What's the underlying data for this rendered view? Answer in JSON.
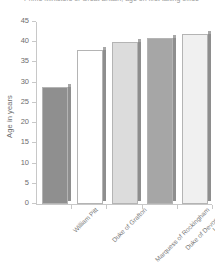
{
  "chart_data": {
    "type": "bar",
    "title": "Prime Ministers of Great Britain, age on first taking office",
    "xlabel": "",
    "ylabel": "Age in years",
    "categories": [
      "William Pitt",
      "Duke of Grafton",
      "Marquess of Rockingham",
      "Duke of Devonshire",
      "Lord North"
    ],
    "values": [
      29,
      38,
      40,
      41,
      42
    ],
    "ylim": [
      0,
      45
    ],
    "yticks": [
      0,
      5,
      10,
      15,
      20,
      25,
      30,
      35,
      40,
      45
    ],
    "ytick_labels": [
      "0",
      "5",
      "10",
      "15",
      "20",
      "25",
      "30",
      "35",
      "40",
      "45"
    ],
    "grid": false,
    "legend": null,
    "bar_colors": [
      "#8f8f8f",
      "#ffffff",
      "#dcdcdc",
      "#a6a6a6",
      "#f0f0f0"
    ]
  },
  "axis": {
    "y_title": "Age in years"
  },
  "colors": {
    "axis": "#c8c8c8",
    "text": "#6e6e6e",
    "bar_edge": "#b4b4b4",
    "bar_side": "#8e8e8e",
    "background": "#ffffff"
  }
}
